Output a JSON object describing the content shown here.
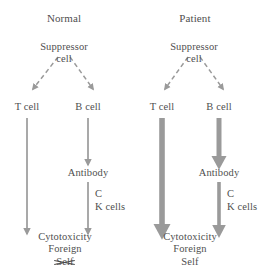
{
  "diagram": {
    "stroke_color": "#9a9a9a",
    "text_color": "#4f4f4f",
    "background_color": "#ffffff",
    "panels": [
      {
        "id": "normal",
        "title": "Normal",
        "suppressor_line1": "Suppressor",
        "suppressor_line2": "cell",
        "t_cell": "T cell",
        "b_cell": "B cell",
        "antibody": "Antibody",
        "cofactor_line1": "C",
        "cofactor_line2": "K cells",
        "outcome_line1": "Cytotoxicity",
        "outcome_line2": "Foreign",
        "outcome_line3": "Self",
        "outcome_line3_struck": true,
        "t_cell_arrow_weight": "thin",
        "b_cell_arrow_weight": "thin",
        "antibody_arrow_weight": "thin"
      },
      {
        "id": "patient",
        "title": "Patient",
        "suppressor_line1": "Suppressor",
        "suppressor_line2": "cell",
        "t_cell": "T cell",
        "b_cell": "B cell",
        "antibody": "Antibody",
        "cofactor_line1": "C",
        "cofactor_line2": "K cells",
        "outcome_line1": "Cytotoxicity",
        "outcome_line2": "Foreign",
        "outcome_line3": "Self",
        "outcome_line3_struck": false,
        "t_cell_arrow_weight": "thick",
        "b_cell_arrow_weight": "thick",
        "antibody_arrow_weight": "medium"
      }
    ]
  }
}
